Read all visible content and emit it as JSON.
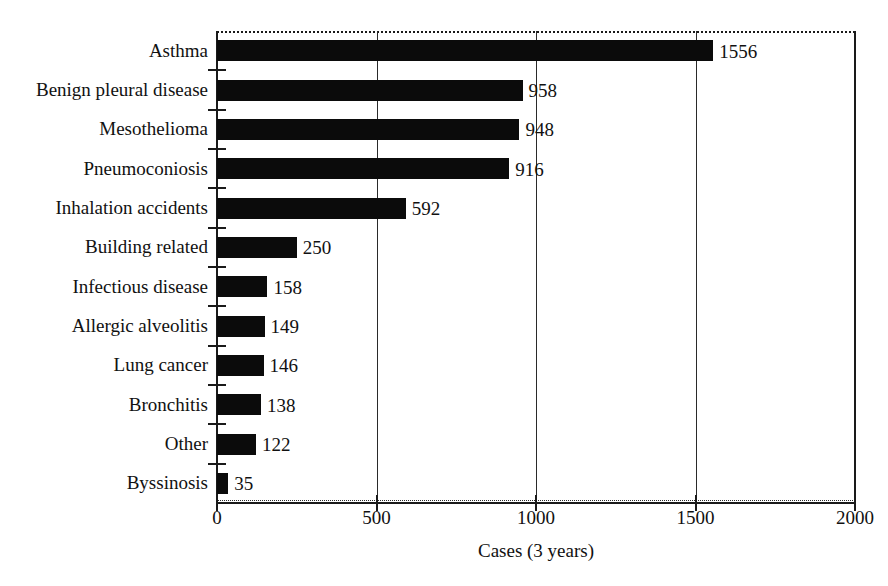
{
  "chart_data": {
    "type": "bar",
    "orientation": "horizontal",
    "title": "",
    "xlabel": "Cases (3 years)",
    "ylabel": "",
    "xlim": [
      0,
      2000
    ],
    "xticks": [
      0,
      500,
      1000,
      1500,
      2000
    ],
    "xtick_labels": [
      "0",
      "500",
      "1000",
      "1500",
      "2000"
    ],
    "grid": "vertical",
    "legend": "none",
    "bar_color": "#0b0b0b",
    "categories": [
      "Asthma",
      "Benign pleural disease",
      "Mesothelioma",
      "Pneumoconiosis",
      "Inhalation accidents",
      "Building related",
      "Infectious disease",
      "Allergic alveolitis",
      "Lung cancer",
      "Bronchitis",
      "Other",
      "Byssinosis"
    ],
    "values": [
      1556,
      958,
      948,
      916,
      592,
      250,
      158,
      149,
      146,
      138,
      122,
      35
    ],
    "value_labels": [
      "1556",
      "958",
      "948",
      "916",
      "592",
      "250",
      "158",
      "149",
      "146",
      "138",
      "122",
      "35"
    ]
  }
}
